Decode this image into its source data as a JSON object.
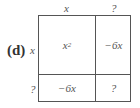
{
  "part_label": "(d)",
  "column_headers": [
    "x",
    "?"
  ],
  "row_headers": [
    "x",
    "?"
  ],
  "cells": [
    [
      {
        "base": "x",
        "exponent": "2"
      },
      {
        "text": "−6x"
      }
    ],
    [
      {
        "text": "−6x"
      },
      {
        "text": "?"
      }
    ]
  ]
}
